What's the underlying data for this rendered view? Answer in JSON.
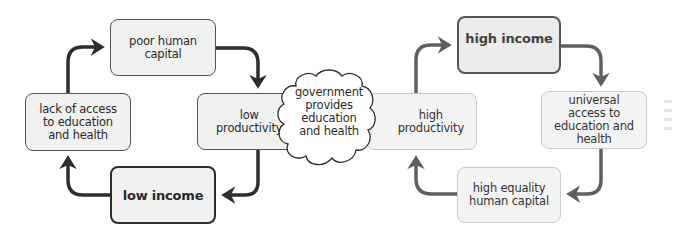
{
  "diagram": {
    "left_cycle": {
      "color": "#2e2e2e",
      "nodes": [
        {
          "id": "poor-human-capital",
          "label": "poor human\ncapital"
        },
        {
          "id": "low-productivity",
          "label": "low\nproductivity"
        },
        {
          "id": "low-income",
          "label": "low income"
        },
        {
          "id": "lack-of-access",
          "label": "lack of access\nto education\nand health"
        }
      ],
      "edges": [
        [
          "poor-human-capital",
          "low-productivity"
        ],
        [
          "low-productivity",
          "low-income"
        ],
        [
          "low-income",
          "lack-of-access"
        ],
        [
          "lack-of-access",
          "poor-human-capital"
        ]
      ]
    },
    "intervention": {
      "shape": "cloud",
      "label": "government\nprovides\neducation\nand health"
    },
    "right_cycle": {
      "color": "#5f5f5f",
      "nodes": [
        {
          "id": "high-income",
          "label": "high income"
        },
        {
          "id": "universal-access",
          "label": "universal\naccess to\neducation and\nhealth"
        },
        {
          "id": "high-equality-human-capital",
          "label": "high equality\nhuman capital"
        },
        {
          "id": "high-productivity",
          "label": "high\nproductivity"
        }
      ],
      "edges": [
        [
          "high-income",
          "universal-access"
        ],
        [
          "universal-access",
          "high-equality-human-capital"
        ],
        [
          "high-equality-human-capital",
          "high-productivity"
        ],
        [
          "high-productivity",
          "high-income"
        ]
      ]
    }
  }
}
